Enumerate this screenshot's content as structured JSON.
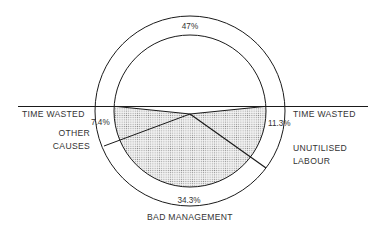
{
  "diagram": {
    "top_label": "47%",
    "segments": [
      {
        "name": "Time wasted — Other causes",
        "label_lines": [
          "TIME WASTED",
          "OTHER",
          "CAUSES"
        ],
        "value": "7.4%"
      },
      {
        "name": "Time wasted — Unutilised labour",
        "label_lines": [
          "TIME WASTED",
          "UNUTILISED",
          "LABOUR"
        ],
        "value": "11.3%"
      },
      {
        "name": "Time wasted — Bad management",
        "label": "BAD MANAGEMENT",
        "value": "34.3%"
      }
    ],
    "labels": {
      "left_heading": "TIME WASTED",
      "right_heading": "TIME WASTED",
      "other_causes_1": "OTHER",
      "other_causes_2": "CAUSES",
      "unutilised_1": "UNUTILISED",
      "unutilised_2": "LABOUR",
      "bad_management": "BAD MANAGEMENT",
      "pct_top": "47%",
      "pct_left": "7.4%",
      "pct_right": "11.3%",
      "pct_bottom": "34.3%"
    },
    "colors": {
      "line": "#1a1a1a",
      "shade": "#b8b8b8",
      "background": "#ffffff"
    }
  }
}
